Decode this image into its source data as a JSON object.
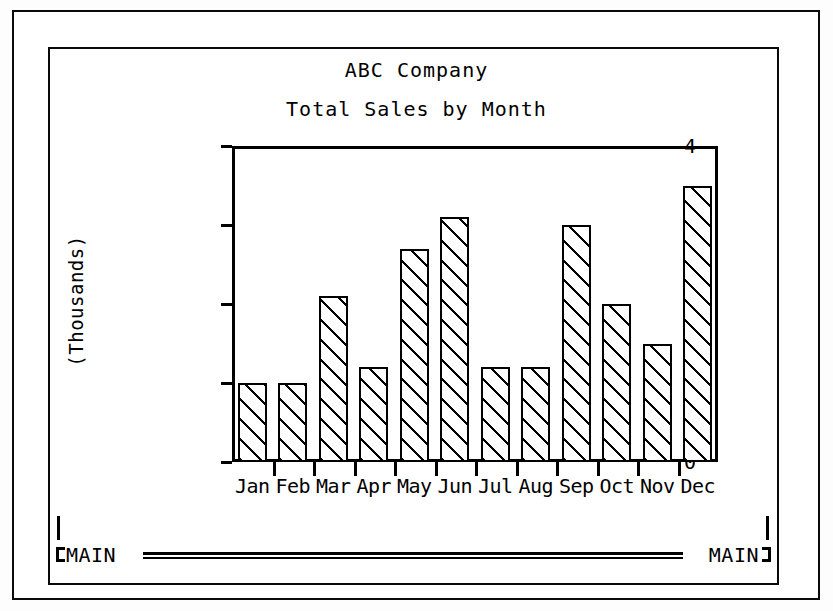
{
  "window": {
    "frame_style": "double-rectangle",
    "border_color": "#000000",
    "background": "#ffffff"
  },
  "header": {
    "title": "ABC Company",
    "subtitle": "Total Sales by Month"
  },
  "footer": {
    "left_label": "MAIN",
    "right_label": "MAIN"
  },
  "chart_data": {
    "type": "bar",
    "title": "ABC Company",
    "subtitle": "Total Sales by Month",
    "xlabel": "",
    "ylabel": "(Thousands)",
    "categories": [
      "Jan",
      "Feb",
      "Mar",
      "Apr",
      "May",
      "Jun",
      "Jul",
      "Aug",
      "Sep",
      "Oct",
      "Nov",
      "Dec"
    ],
    "values": [
      1.0,
      1.0,
      2.1,
      1.2,
      2.7,
      3.1,
      1.2,
      1.2,
      3.0,
      2.0,
      1.5,
      3.5
    ],
    "ylim": [
      0,
      4
    ],
    "yticks": [
      0,
      1,
      2,
      3,
      4
    ],
    "ytick_labels": [
      "0",
      "1",
      "2",
      "3",
      "4"
    ],
    "grid": false,
    "legend": false,
    "bar_fill": "diagonal-hatch",
    "bar_edge_color": "#000000",
    "bar_face_color": "#ffffff"
  }
}
